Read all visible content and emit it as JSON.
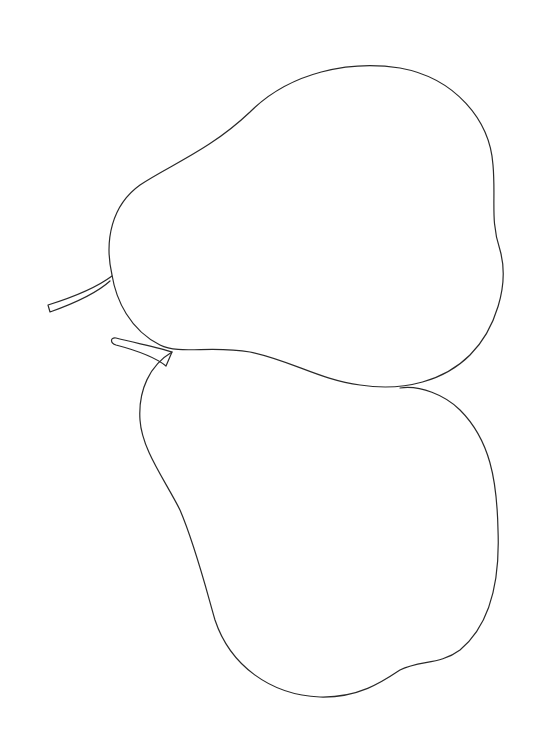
{
  "image": {
    "description": "Line drawing of two pears",
    "subjects": [
      "upper-pear",
      "lower-pear"
    ],
    "stroke_color": "#2a2a2a",
    "background": "#ffffff"
  }
}
